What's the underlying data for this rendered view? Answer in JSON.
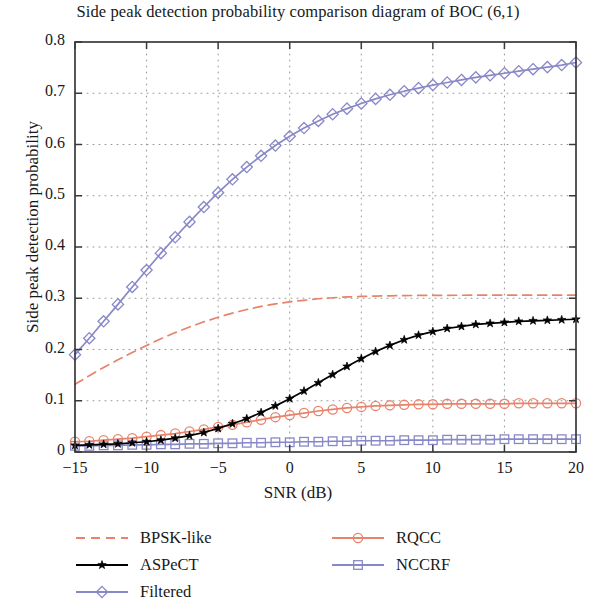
{
  "chart_data": {
    "type": "line",
    "title": "Side peak detection probability comparison diagram of BOC (6,1)",
    "xlabel": "SNR (dB)",
    "ylabel": "Side peak detection probability",
    "xlim": [
      -15,
      20
    ],
    "ylim": [
      0,
      0.8
    ],
    "xticks": [
      -15,
      -10,
      -5,
      0,
      5,
      10,
      15,
      20
    ],
    "xtick_labels": [
      "−15",
      "−10",
      "−5",
      "0",
      "5",
      "10",
      "15",
      "20"
    ],
    "yticks": [
      0,
      0.1,
      0.2,
      0.3,
      0.4,
      0.5,
      0.6,
      0.7,
      0.8
    ],
    "ytick_labels": [
      "0",
      "0.1",
      "0.2",
      "0.3",
      "0.4",
      "0.5",
      "0.6",
      "0.7",
      "0.8"
    ],
    "grid": true,
    "grid_style": "dotted",
    "legend_position": "below-plot",
    "x": [
      -15,
      -14,
      -13,
      -12,
      -11,
      -10,
      -9,
      -8,
      -7,
      -6,
      -5,
      -4,
      -3,
      -2,
      -1,
      0,
      1,
      2,
      3,
      4,
      5,
      6,
      7,
      8,
      9,
      10,
      11,
      12,
      13,
      14,
      15,
      16,
      17,
      18,
      19,
      20
    ],
    "series": [
      {
        "name": "BPSK-like",
        "color": "#e8836b",
        "style": "dashed",
        "marker": "none",
        "values": [
          0.132,
          0.149,
          0.165,
          0.18,
          0.194,
          0.208,
          0.221,
          0.233,
          0.244,
          0.254,
          0.263,
          0.271,
          0.278,
          0.284,
          0.289,
          0.293,
          0.296,
          0.299,
          0.301,
          0.3025,
          0.3035,
          0.3042,
          0.3048,
          0.3052,
          0.3055,
          0.3057,
          0.3058,
          0.3059,
          0.306,
          0.306,
          0.306,
          0.306,
          0.306,
          0.306,
          0.306,
          0.306
        ]
      },
      {
        "name": "ASPeCT",
        "color": "#000000",
        "style": "solid",
        "marker": "star",
        "values": [
          0.013,
          0.014,
          0.015,
          0.016,
          0.018,
          0.02,
          0.023,
          0.027,
          0.032,
          0.038,
          0.046,
          0.055,
          0.065,
          0.077,
          0.09,
          0.104,
          0.119,
          0.135,
          0.151,
          0.167,
          0.182,
          0.196,
          0.208,
          0.219,
          0.228,
          0.235,
          0.241,
          0.245,
          0.249,
          0.251,
          0.253,
          0.255,
          0.256,
          0.257,
          0.258,
          0.259
        ]
      },
      {
        "name": "Filtered",
        "color": "#8888c8",
        "style": "solid",
        "marker": "diamond",
        "values": [
          0.19,
          0.222,
          0.255,
          0.288,
          0.322,
          0.355,
          0.388,
          0.419,
          0.449,
          0.478,
          0.506,
          0.532,
          0.556,
          0.578,
          0.598,
          0.616,
          0.632,
          0.646,
          0.659,
          0.67,
          0.68,
          0.689,
          0.697,
          0.704,
          0.71,
          0.716,
          0.721,
          0.726,
          0.731,
          0.735,
          0.739,
          0.743,
          0.747,
          0.751,
          0.755,
          0.76
        ]
      },
      {
        "name": "RQCC",
        "color": "#e8836b",
        "style": "solid",
        "marker": "circle",
        "values": [
          0.02,
          0.021,
          0.023,
          0.025,
          0.027,
          0.03,
          0.033,
          0.036,
          0.04,
          0.044,
          0.049,
          0.053,
          0.058,
          0.063,
          0.068,
          0.072,
          0.076,
          0.08,
          0.083,
          0.086,
          0.088,
          0.09,
          0.091,
          0.092,
          0.093,
          0.093,
          0.094,
          0.094,
          0.094,
          0.094,
          0.094,
          0.095,
          0.095,
          0.095,
          0.095,
          0.095
        ]
      },
      {
        "name": "NCCRF",
        "color": "#8888c8",
        "style": "solid",
        "marker": "square",
        "values": [
          0.012,
          0.012,
          0.013,
          0.013,
          0.014,
          0.014,
          0.015,
          0.015,
          0.016,
          0.016,
          0.017,
          0.017,
          0.018,
          0.018,
          0.019,
          0.019,
          0.02,
          0.02,
          0.021,
          0.021,
          0.022,
          0.022,
          0.022,
          0.023,
          0.023,
          0.023,
          0.024,
          0.024,
          0.024,
          0.024,
          0.025,
          0.025,
          0.025,
          0.025,
          0.025,
          0.025
        ]
      }
    ]
  },
  "legend": {
    "entries": [
      {
        "label": "BPSK-like",
        "column": "left"
      },
      {
        "label": "ASPeCT",
        "column": "left"
      },
      {
        "label": "Filtered",
        "column": "left"
      },
      {
        "label": "RQCC",
        "column": "right"
      },
      {
        "label": "NCCRF",
        "column": "right"
      }
    ]
  },
  "colors": {
    "salmon": "#e8836b",
    "purple": "#8888c8",
    "black": "#000000",
    "axis": "#3a3a3a",
    "grid": "#999999",
    "background": "#ffffff"
  }
}
